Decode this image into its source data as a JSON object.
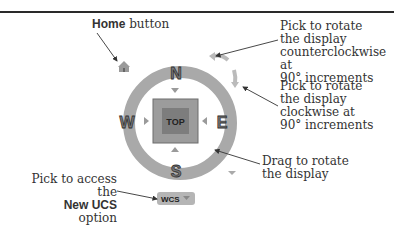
{
  "labels": {
    "home": {
      "bold": "Home",
      "rest": " button"
    },
    "ccw": [
      "Pick to rotate",
      "the display",
      "counterclockwise at",
      "90° increments"
    ],
    "cw": [
      "Pick to rotate",
      "the display",
      "clockwise at",
      "90° increments"
    ],
    "drag": [
      "Drag to rotate",
      "the display"
    ],
    "ucs": {
      "line1": "Pick to access the",
      "bold": "New UCS",
      "rest": " option"
    }
  },
  "viewcube": {
    "face": "TOP",
    "north": "N",
    "south": "S",
    "east": "E",
    "west": "W",
    "wcs_label": "WCS",
    "ring_color": "#a9a9a9",
    "face_color": "#8a8a8a",
    "face_inner_color": "#7a7a7a"
  }
}
